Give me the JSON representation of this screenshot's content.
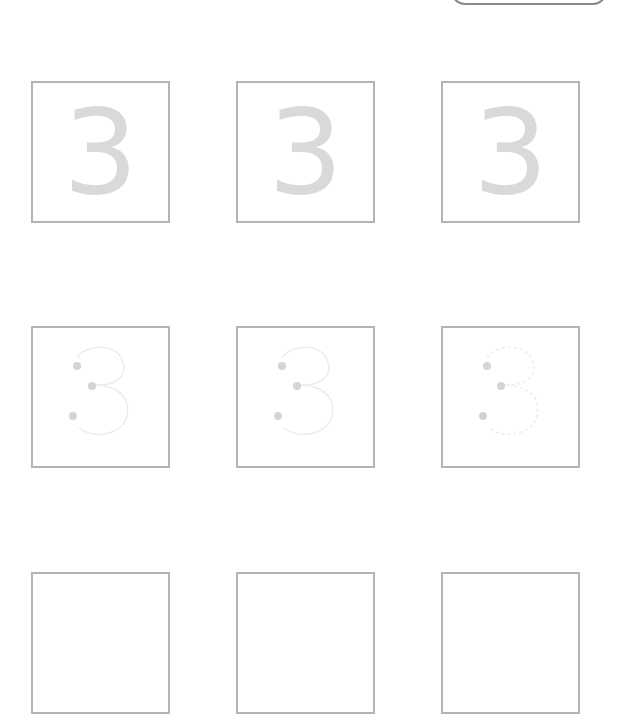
{
  "worksheet": {
    "digit": "3",
    "top_button": {
      "label": ""
    },
    "colors": {
      "box_border": "#b4b4b4",
      "solid_digit": "#d9d9d9",
      "trace_line": "#ececec",
      "start_dot": "#d4d4d4"
    },
    "rows": [
      {
        "type": "solid",
        "cells": [
          {
            "digit": "3"
          },
          {
            "digit": "3"
          },
          {
            "digit": "3"
          }
        ]
      },
      {
        "type": "trace",
        "cells": [
          {
            "style": "solid"
          },
          {
            "style": "solid"
          },
          {
            "style": "dotted"
          }
        ]
      },
      {
        "type": "blank",
        "cells": [
          {},
          {},
          {}
        ]
      }
    ]
  }
}
